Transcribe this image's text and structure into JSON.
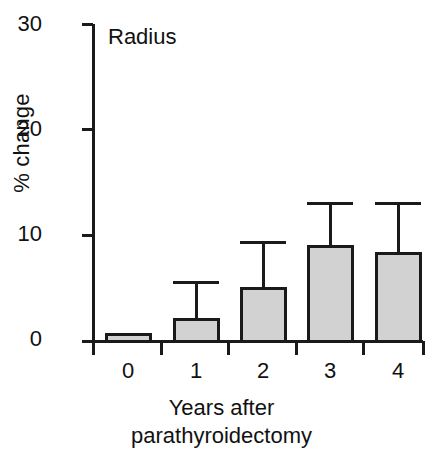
{
  "chart_data": {
    "type": "bar",
    "title": "",
    "panel_label": "Radius",
    "xlabel_lines": [
      "Years after",
      "parathyroidectomy"
    ],
    "xlabel": "Years after parathyroidectomy",
    "ylabel": "% change",
    "categories": [
      "0",
      "1",
      "2",
      "3",
      "4"
    ],
    "values": [
      0.6,
      2.0,
      5.0,
      8.9,
      8.3
    ],
    "error_upper": [
      0.6,
      5.5,
      9.3,
      13.0,
      13.0
    ],
    "ylim": [
      0,
      30
    ],
    "yticks": [
      "0",
      "10",
      "20",
      "30"
    ],
    "ytick_values": [
      0,
      10,
      20,
      30
    ],
    "xticklabels": [
      "0",
      "1",
      "2",
      "3",
      "4"
    ],
    "grid": false,
    "legend": "none",
    "series": [
      {
        "name": "Radius",
        "values": [
          0.6,
          2.0,
          5.0,
          8.9,
          8.3
        ],
        "error_upper": [
          0.6,
          5.5,
          9.3,
          13.0,
          13.0
        ]
      }
    ]
  },
  "style": {
    "bar_fill": "#d2d2d2",
    "bar_stroke": "#1a1a1a",
    "axis_color": "#1a1a1a",
    "background": "#ffffff",
    "text_color": "#111111"
  },
  "geometry": {
    "axis_x": 93,
    "baseline_y": 341,
    "top_y": 24,
    "right_x": 423,
    "bar_centers": [
      128,
      196,
      263,
      330,
      398
    ],
    "bar_width": 44,
    "cap_width": 46
  }
}
